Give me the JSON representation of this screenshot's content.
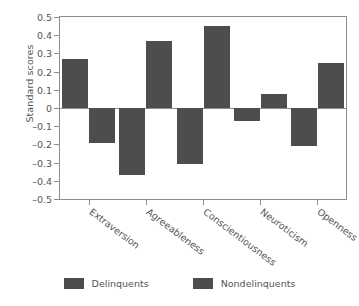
{
  "chart_data": {
    "type": "bar",
    "title": "",
    "xlabel": "",
    "ylabel": "Standard scores",
    "ylim": [
      -0.5,
      0.5
    ],
    "yticks": [
      "0.5",
      "0.4",
      "0.3",
      "0.2",
      "0.1",
      "0",
      "–0.1",
      "–0.2",
      "–0.3",
      "–0.4",
      "–0.5"
    ],
    "ytick_values": [
      0.5,
      0.4,
      0.3,
      0.2,
      0.1,
      0,
      -0.1,
      -0.2,
      -0.3,
      -0.4,
      -0.5
    ],
    "grid": false,
    "legend_position": "bottom",
    "categories": [
      "Extraversion",
      "Agreeableness",
      "Conscientiousness",
      "Neuroticism",
      "Openness"
    ],
    "series": [
      {
        "name": "Delinquents",
        "color": "#4d4d4d",
        "values": [
          0.27,
          -0.37,
          -0.31,
          -0.07,
          -0.21
        ]
      },
      {
        "name": "Nondelinquents",
        "color": "#4d4d4d",
        "values": [
          -0.19,
          0.37,
          0.45,
          0.075,
          0.25
        ]
      }
    ]
  },
  "legend": {
    "items": [
      {
        "label": "Delinquents",
        "color": "#4d4d4d"
      },
      {
        "label": "Nondelinquents",
        "color": "#4d4d4d"
      }
    ]
  },
  "colors": {
    "bar": "#4d4d4d",
    "axis": "#8d8d8d",
    "text": "#555555",
    "background": "#ffffff"
  }
}
